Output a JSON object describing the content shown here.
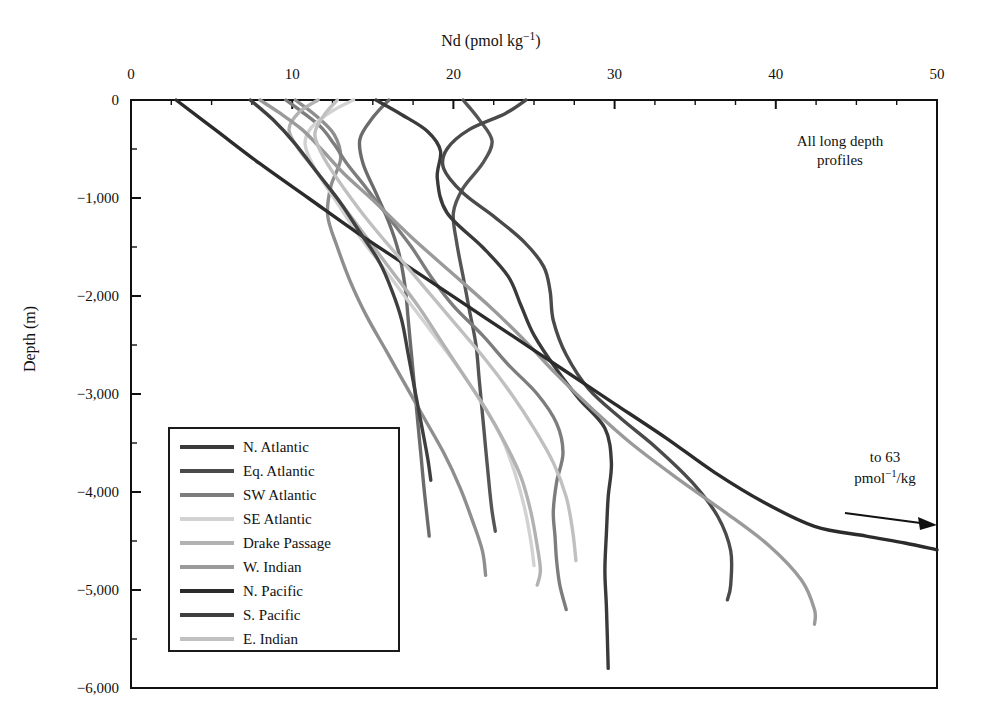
{
  "chart_data": {
    "type": "line",
    "title": "Nd (pmol kg−1)",
    "xlabel": "Nd (pmol kg−1)",
    "ylabel": "Depth (m)",
    "xlim": [
      0,
      50
    ],
    "ylim": [
      -6000,
      0
    ],
    "xticks": [
      0,
      10,
      20,
      30,
      40,
      50
    ],
    "xtick_labels": [
      "0",
      "10",
      "20",
      "30",
      "40",
      "50"
    ],
    "yticks": [
      0,
      -1000,
      -2000,
      -3000,
      -4000,
      -5000,
      -6000
    ],
    "ytick_labels": [
      "0",
      "−1,000",
      "−2,000",
      "−3,000",
      "−4,000",
      "−5,000",
      "−6,000"
    ],
    "minor_ytick_interval": 500,
    "minor_xtick_interval": 2.5,
    "grid": false,
    "legend_position": "lower-left-inside",
    "annotations": [
      {
        "name": "all-long-depth-profiles",
        "text": "All long depth profiles",
        "x": 40.5,
        "y": -450
      },
      {
        "name": "to-63",
        "text": "to 63 pmol−1/kg",
        "x": 45.5,
        "y": -4050
      }
    ],
    "series": [
      {
        "name": "N. Atlantic",
        "color": "#3a3a3a",
        "points": [
          [
            15.2,
            0
          ],
          [
            16.8,
            -150
          ],
          [
            18.4,
            -320
          ],
          [
            19.2,
            -520
          ],
          [
            19.0,
            -800
          ],
          [
            19.6,
            -1150
          ],
          [
            21.8,
            -1500
          ],
          [
            23.4,
            -1800
          ],
          [
            24.2,
            -2100
          ],
          [
            25.0,
            -2400
          ],
          [
            26.4,
            -2750
          ],
          [
            27.8,
            -3050
          ],
          [
            29.4,
            -3350
          ],
          [
            29.8,
            -3700
          ],
          [
            29.6,
            -4050
          ],
          [
            29.5,
            -4400
          ],
          [
            29.4,
            -4800
          ],
          [
            29.5,
            -5200
          ],
          [
            29.6,
            -5800
          ]
        ]
      },
      {
        "name": "Eq. Atlantic",
        "color": "#4a4a4a",
        "points": [
          [
            24.5,
            0
          ],
          [
            23.2,
            -140
          ],
          [
            21.0,
            -300
          ],
          [
            19.6,
            -500
          ],
          [
            19.4,
            -700
          ],
          [
            20.6,
            -950
          ],
          [
            22.6,
            -1200
          ],
          [
            24.4,
            -1450
          ],
          [
            25.6,
            -1700
          ],
          [
            26.0,
            -1950
          ],
          [
            26.2,
            -2250
          ],
          [
            27.0,
            -2600
          ],
          [
            28.4,
            -2950
          ],
          [
            30.4,
            -3250
          ],
          [
            32.6,
            -3550
          ],
          [
            34.8,
            -3900
          ],
          [
            36.4,
            -4250
          ],
          [
            37.2,
            -4600
          ],
          [
            37.2,
            -4950
          ],
          [
            37.0,
            -5100
          ]
        ]
      },
      {
        "name": "SW Atlantic",
        "color": "#7d7d7d",
        "points": [
          [
            9.6,
            0
          ],
          [
            10.6,
            -120
          ],
          [
            11.8,
            -280
          ],
          [
            12.6,
            -450
          ],
          [
            13.4,
            -650
          ],
          [
            14.6,
            -900
          ],
          [
            16.0,
            -1200
          ],
          [
            17.4,
            -1500
          ],
          [
            18.6,
            -1800
          ],
          [
            20.0,
            -2100
          ],
          [
            21.8,
            -2400
          ],
          [
            23.4,
            -2700
          ],
          [
            25.2,
            -3000
          ],
          [
            26.4,
            -3300
          ],
          [
            26.8,
            -3600
          ],
          [
            26.4,
            -3900
          ],
          [
            26.2,
            -4200
          ],
          [
            26.3,
            -4450
          ],
          [
            26.4,
            -4700
          ],
          [
            26.6,
            -4950
          ],
          [
            27.0,
            -5200
          ]
        ]
      },
      {
        "name": "SE Atlantic",
        "color": "#d2d2d2",
        "points": [
          [
            13.8,
            0
          ],
          [
            12.4,
            -120
          ],
          [
            11.2,
            -280
          ],
          [
            10.8,
            -450
          ],
          [
            11.4,
            -700
          ],
          [
            12.6,
            -1000
          ],
          [
            14.0,
            -1350
          ],
          [
            15.6,
            -1700
          ],
          [
            17.2,
            -2050
          ],
          [
            18.8,
            -2400
          ],
          [
            20.4,
            -2750
          ],
          [
            21.8,
            -3100
          ],
          [
            23.0,
            -3450
          ],
          [
            23.8,
            -3800
          ],
          [
            24.4,
            -4150
          ],
          [
            24.8,
            -4500
          ],
          [
            25.0,
            -4750
          ]
        ]
      },
      {
        "name": "Drake Passage",
        "color": "#b2b2b2",
        "points": [
          [
            11.6,
            0
          ],
          [
            10.4,
            -130
          ],
          [
            9.8,
            -300
          ],
          [
            10.4,
            -500
          ],
          [
            11.6,
            -750
          ],
          [
            13.0,
            -1050
          ],
          [
            14.6,
            -1400
          ],
          [
            16.2,
            -1750
          ],
          [
            17.8,
            -2100
          ],
          [
            19.2,
            -2450
          ],
          [
            20.6,
            -2800
          ],
          [
            22.0,
            -3150
          ],
          [
            23.2,
            -3500
          ],
          [
            24.2,
            -3850
          ],
          [
            24.8,
            -4200
          ],
          [
            25.2,
            -4550
          ],
          [
            25.4,
            -4800
          ],
          [
            25.2,
            -4950
          ]
        ]
      },
      {
        "name": "W. Indian",
        "color": "#9a9a9a",
        "points": [
          [
            8.0,
            0
          ],
          [
            9.2,
            -130
          ],
          [
            10.6,
            -300
          ],
          [
            11.8,
            -500
          ],
          [
            13.2,
            -750
          ],
          [
            15.2,
            -1050
          ],
          [
            17.4,
            -1400
          ],
          [
            19.8,
            -1750
          ],
          [
            22.2,
            -2100
          ],
          [
            24.4,
            -2450
          ],
          [
            26.4,
            -2800
          ],
          [
            28.6,
            -3150
          ],
          [
            31.0,
            -3500
          ],
          [
            33.8,
            -3850
          ],
          [
            36.8,
            -4200
          ],
          [
            39.6,
            -4550
          ],
          [
            41.6,
            -4900
          ],
          [
            42.4,
            -5200
          ],
          [
            42.4,
            -5350
          ]
        ]
      },
      {
        "name": "N. Pacific",
        "color": "#2b2b2b",
        "points": [
          [
            2.8,
            0
          ],
          [
            5.2,
            -300
          ],
          [
            8.0,
            -650
          ],
          [
            11.0,
            -1000
          ],
          [
            14.0,
            -1350
          ],
          [
            17.2,
            -1700
          ],
          [
            20.4,
            -2050
          ],
          [
            23.6,
            -2400
          ],
          [
            26.8,
            -2750
          ],
          [
            30.0,
            -3100
          ],
          [
            33.2,
            -3450
          ],
          [
            36.2,
            -3800
          ],
          [
            39.2,
            -4100
          ],
          [
            42.4,
            -4350
          ],
          [
            45.6,
            -4450
          ],
          [
            48.0,
            -4520
          ],
          [
            50.0,
            -4590
          ]
        ]
      },
      {
        "name": "S. Pacific",
        "color": "#3f3f3f",
        "points": [
          [
            7.4,
            0
          ],
          [
            8.8,
            -200
          ],
          [
            10.2,
            -450
          ],
          [
            11.6,
            -750
          ],
          [
            13.0,
            -1050
          ],
          [
            14.2,
            -1350
          ],
          [
            15.4,
            -1650
          ],
          [
            16.2,
            -1950
          ],
          [
            16.8,
            -2250
          ],
          [
            17.2,
            -2600
          ],
          [
            17.6,
            -2950
          ],
          [
            18.0,
            -3300
          ],
          [
            18.4,
            -3650
          ],
          [
            18.6,
            -3880
          ]
        ]
      },
      {
        "name": "E. Indian",
        "color": "#c0c0c0",
        "points": [
          [
            12.8,
            0
          ],
          [
            12.0,
            -150
          ],
          [
            11.4,
            -350
          ],
          [
            12.0,
            -600
          ],
          [
            13.2,
            -900
          ],
          [
            14.8,
            -1250
          ],
          [
            16.6,
            -1600
          ],
          [
            18.4,
            -1950
          ],
          [
            20.2,
            -2300
          ],
          [
            22.0,
            -2650
          ],
          [
            23.6,
            -3000
          ],
          [
            25.0,
            -3350
          ],
          [
            26.2,
            -3700
          ],
          [
            27.0,
            -4050
          ],
          [
            27.4,
            -4400
          ],
          [
            27.6,
            -4700
          ]
        ]
      }
    ],
    "extra_curves": [
      {
        "name": "unlabeled-deep-1",
        "color": "#555555",
        "points": [
          [
            20.6,
            0
          ],
          [
            21.6,
            -200
          ],
          [
            22.4,
            -420
          ],
          [
            21.8,
            -650
          ],
          [
            20.6,
            -900
          ],
          [
            20.0,
            -1150
          ],
          [
            20.2,
            -1450
          ],
          [
            20.6,
            -1800
          ],
          [
            21.0,
            -2150
          ],
          [
            21.4,
            -2500
          ],
          [
            21.6,
            -2850
          ],
          [
            21.8,
            -3200
          ],
          [
            22.0,
            -3550
          ],
          [
            22.2,
            -3900
          ],
          [
            22.4,
            -4200
          ],
          [
            22.6,
            -4400
          ]
        ]
      },
      {
        "name": "unlabeled-deep-2",
        "color": "#6b6b6b",
        "points": [
          [
            16.0,
            0
          ],
          [
            15.0,
            -180
          ],
          [
            14.2,
            -400
          ],
          [
            14.4,
            -650
          ],
          [
            15.2,
            -950
          ],
          [
            16.0,
            -1250
          ],
          [
            16.6,
            -1550
          ],
          [
            17.0,
            -1900
          ],
          [
            17.2,
            -2250
          ],
          [
            17.4,
            -2600
          ],
          [
            17.6,
            -2950
          ],
          [
            17.8,
            -3300
          ],
          [
            18.0,
            -3650
          ],
          [
            18.2,
            -4000
          ],
          [
            18.4,
            -4300
          ],
          [
            18.5,
            -4450
          ]
        ]
      },
      {
        "name": "unlabeled-deep-3",
        "color": "#8e8e8e",
        "points": [
          [
            10.2,
            0
          ],
          [
            11.4,
            -150
          ],
          [
            12.6,
            -350
          ],
          [
            13.0,
            -600
          ],
          [
            12.4,
            -880
          ],
          [
            12.2,
            -1180
          ],
          [
            12.8,
            -1500
          ],
          [
            13.6,
            -1850
          ],
          [
            14.6,
            -2200
          ],
          [
            15.8,
            -2550
          ],
          [
            17.0,
            -2900
          ],
          [
            18.2,
            -3250
          ],
          [
            19.4,
            -3600
          ],
          [
            20.4,
            -3950
          ],
          [
            21.2,
            -4300
          ],
          [
            21.8,
            -4600
          ],
          [
            22.0,
            -4850
          ]
        ]
      }
    ]
  },
  "chart": {
    "title": {
      "pre": "Nd (pmol kg",
      "sup": "−1",
      "post": ")"
    },
    "ylabel": "Depth (m)",
    "xtick_labels": [
      "0",
      "10",
      "20",
      "30",
      "40",
      "50"
    ],
    "ytick_labels": [
      "0",
      "−1,000",
      "−2,000",
      "−3,000",
      "−4,000",
      "−5,000",
      "−6,000"
    ]
  },
  "notes": {
    "all_long_line1": "All long depth",
    "all_long_line2": "profiles",
    "to63_line1": "to 63",
    "to63_pre": "pmol",
    "to63_sup": "−1",
    "to63_post": "/kg"
  },
  "legend": {
    "items": [
      {
        "label": "N. Atlantic",
        "color": "#3a3a3a"
      },
      {
        "label": "Eq. Atlantic",
        "color": "#4a4a4a"
      },
      {
        "label": "SW Atlantic",
        "color": "#7d7d7d"
      },
      {
        "label": "SE Atlantic",
        "color": "#d2d2d2"
      },
      {
        "label": "Drake Passage",
        "color": "#b2b2b2"
      },
      {
        "label": "W. Indian",
        "color": "#9a9a9a"
      },
      {
        "label": "N. Pacific",
        "color": "#2b2b2b"
      },
      {
        "label": "S. Pacific",
        "color": "#3f3f3f"
      },
      {
        "label": "E. Indian",
        "color": "#c0c0c0"
      }
    ]
  }
}
